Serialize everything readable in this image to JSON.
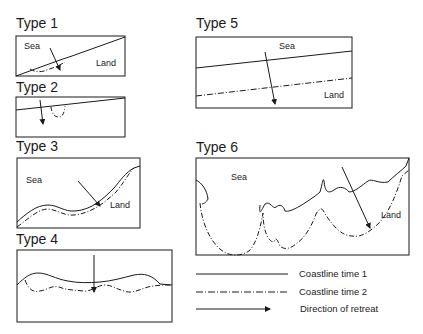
{
  "panels": [
    {
      "id": "type-1",
      "title": "Type 1",
      "labels": {
        "sea": "Sea",
        "land": "Land"
      }
    },
    {
      "id": "type-2",
      "title": "Type 2",
      "labels": {}
    },
    {
      "id": "type-3",
      "title": "Type 3",
      "labels": {
        "sea": "Sea",
        "land": "Land"
      }
    },
    {
      "id": "type-4",
      "title": "Type 4",
      "labels": {}
    },
    {
      "id": "type-5",
      "title": "Type 5",
      "labels": {
        "sea": "Sea",
        "land": "Land"
      }
    },
    {
      "id": "type-6",
      "title": "Type 6",
      "labels": {
        "sea": "Sea",
        "land": "Land"
      }
    }
  ],
  "legend": {
    "items": [
      {
        "style": "solid",
        "label": "Coastline time 1"
      },
      {
        "style": "dash-dot",
        "label": "Coastline time 2"
      },
      {
        "style": "arrow",
        "label": "Direction of retreat"
      }
    ]
  },
  "colors": {
    "line": "#1a1a1a",
    "background": "#ffffff"
  }
}
